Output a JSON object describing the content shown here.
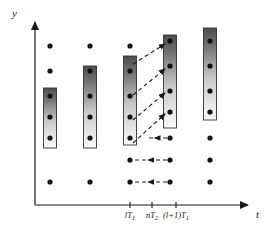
{
  "figure": {
    "type": "timing-scatter-diagram",
    "background_color": "#ffffff",
    "ink_color": "#1a1a1a",
    "axes": {
      "y_axis": {
        "label": "y",
        "x": 35,
        "y_top": 18,
        "y_bottom": 205,
        "arrow": "up"
      },
      "x_axis": {
        "label": "t",
        "y": 205,
        "x_left": 35,
        "x_right": 252,
        "arrow": "right"
      }
    },
    "ticks": [
      {
        "label": "lT",
        "sub": "1",
        "x": 130,
        "y": 205,
        "text": "lT1"
      },
      {
        "label": "nT",
        "sub": "2",
        "x": 152,
        "y": 205,
        "text": "nT2"
      },
      {
        "label": "(l+1)T",
        "sub": "1",
        "x": 176,
        "y": 205,
        "text": "(l+1)T1"
      }
    ],
    "tick_label_y": 211,
    "dot": {
      "radius": 2.6,
      "color": "#111111"
    },
    "columns": [
      {
        "name": "column-1",
        "x": 50,
        "dots_y": [
          46,
          71,
          96,
          117,
          138,
          182
        ],
        "box": {
          "top": 88,
          "bottom": 148,
          "width": 13
        }
      },
      {
        "name": "column-2",
        "x": 90,
        "dots_y": [
          46,
          71,
          96,
          117,
          138,
          182
        ],
        "box": {
          "top": 66,
          "bottom": 148,
          "width": 13
        }
      },
      {
        "name": "column-3",
        "x": 130,
        "dots_y": [
          46,
          71,
          96,
          117,
          138,
          160,
          182
        ],
        "box": {
          "top": 56,
          "bottom": 145,
          "width": 13
        }
      },
      {
        "name": "column-4",
        "x": 170,
        "dots_y": [
          41,
          66,
          91,
          112,
          138,
          160,
          182
        ],
        "box": {
          "top": 35,
          "bottom": 128,
          "width": 13
        }
      },
      {
        "name": "column-5",
        "x": 210,
        "dots_y": [
          41,
          66,
          91,
          112,
          138,
          160,
          182
        ],
        "box": {
          "top": 28,
          "bottom": 120,
          "width": 13
        }
      }
    ],
    "box_gradient": {
      "top_color": "#4d4d4d",
      "bottom_color": "#f7f7f7",
      "stroke": "#333333"
    },
    "diagonal_arrows": [
      {
        "x1": 133,
        "y1": 64,
        "x2": 165,
        "y2": 44,
        "direction": "up-right"
      },
      {
        "x1": 133,
        "y1": 95,
        "x2": 165,
        "y2": 69,
        "direction": "up-right"
      },
      {
        "x1": 133,
        "y1": 120,
        "x2": 165,
        "y2": 93,
        "direction": "up-right"
      },
      {
        "x1": 133,
        "y1": 143,
        "x2": 165,
        "y2": 114,
        "direction": "up-right"
      }
    ],
    "horizontal_arrows": [
      {
        "x_from": 167,
        "x_to": 146,
        "y": 138,
        "direction": "left"
      },
      {
        "x_from": 167,
        "x_to": 133,
        "y": 160,
        "direction": "left"
      },
      {
        "x_from": 167,
        "x_to": 133,
        "y": 182,
        "direction": "left"
      }
    ]
  },
  "chart_data": {
    "type": "scatter",
    "title": "",
    "xlabel": "t",
    "ylabel": "y",
    "grid": false,
    "legend": null,
    "xtick_labels": [
      "lT1",
      "nT2",
      "(l+1)T1"
    ],
    "xtick_values": [
      130,
      152,
      176
    ],
    "series": [
      {
        "name": "column-1",
        "x": 50,
        "values": [
          46,
          71,
          96,
          117,
          138,
          182
        ]
      },
      {
        "name": "column-2",
        "x": 90,
        "values": [
          46,
          71,
          96,
          117,
          138,
          182
        ]
      },
      {
        "name": "column-3",
        "x": 130,
        "values": [
          46,
          71,
          96,
          117,
          138,
          160,
          182
        ]
      },
      {
        "name": "column-4",
        "x": 170,
        "values": [
          41,
          66,
          91,
          112,
          138,
          160,
          182
        ]
      },
      {
        "name": "column-5",
        "x": 210,
        "values": [
          41,
          66,
          91,
          112,
          138,
          160,
          182
        ]
      }
    ],
    "annotations": [
      "4 diagonal dashed arrows from column-3 toward column-4 (up-right)",
      "3 horizontal dashed arrows pointing left from column-4 toward column-3"
    ]
  }
}
